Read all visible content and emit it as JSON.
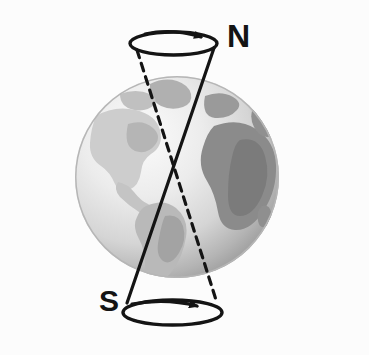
{
  "figure": {
    "background_color": "#fcfcfc",
    "width": 369,
    "height": 355
  },
  "labels": {
    "north_pole": "N",
    "south_pole": "S"
  },
  "globe": {
    "name": "earth-globe",
    "center_x": 177,
    "center_y": 177,
    "radius_x": 102,
    "radius_y": 101,
    "ocean_light_color": "#f2f2f2",
    "ocean_mid_color": "#d9d9d9",
    "ocean_shadow_color": "#a8a8a8",
    "land_light_color": "#bdbdbd",
    "land_dark_color": "#8a8a8a",
    "continents": [
      "North America",
      "South America",
      "Africa",
      "Europe",
      "Greenland"
    ]
  },
  "precession": {
    "line_color": "#141414",
    "top_circle": {
      "name": "north-precession-circle",
      "cx": 173.5,
      "cy": 43.5,
      "rx": 43.5,
      "ry": 11.5,
      "arrow_direction": "clockwise-right"
    },
    "bottom_circle": {
      "name": "south-precession-circle",
      "cx": 172.5,
      "cy": 312.5,
      "rx": 49.5,
      "ry": 12.5,
      "arrow_direction": "clockwise-right"
    },
    "solid_axis": {
      "name": "current-rotation-axis",
      "style": "solid",
      "x1": 214,
      "y1": 48,
      "x2": 127,
      "y2": 303
    },
    "dashed_axis": {
      "name": "future-rotation-axis",
      "style": "dashed",
      "x1": 137,
      "y1": 50,
      "x2": 217,
      "y2": 303
    }
  }
}
